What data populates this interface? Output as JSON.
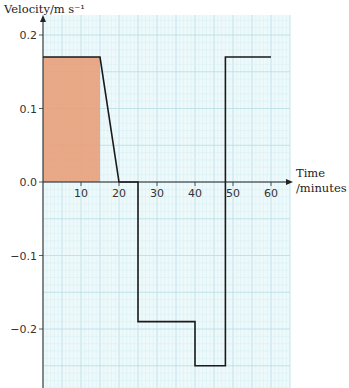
{
  "chart_data": {
    "type": "line",
    "title": "",
    "xlabel": "Time /minutes",
    "xlabel_line1": "Time",
    "xlabel_line2": "/minutes",
    "ylabel": "Velocity/m s⁻¹",
    "xlim": [
      0,
      65
    ],
    "ylim": [
      -0.27,
      0.22
    ],
    "x_ticks": [
      10,
      20,
      30,
      40,
      50,
      60
    ],
    "x_tick_labels": [
      "10",
      "20",
      "30",
      "40",
      "50",
      "60"
    ],
    "y_ticks": [
      0.2,
      0.1,
      0.0,
      -0.1,
      -0.2
    ],
    "y_tick_labels": [
      "0.2",
      "0.1",
      "0.0",
      "−0.1",
      "−0.2"
    ],
    "grid": true,
    "series": [
      {
        "name": "velocity",
        "x": [
          0,
          15,
          20,
          25,
          25,
          40,
          40,
          48,
          48,
          60
        ],
        "y": [
          0.17,
          0.17,
          0.0,
          0.0,
          -0.19,
          -0.19,
          -0.25,
          -0.25,
          0.17,
          0.17
        ]
      }
    ],
    "shaded_region": {
      "x": [
        0,
        15
      ],
      "y": [
        0,
        0.17
      ],
      "color": "#e8a07a"
    },
    "colors": {
      "grid_minor": "#d4eef2",
      "grid_major": "#b5dde6",
      "paper": "#eef9fb",
      "line": "#1a1a1a",
      "shade": "#e8a07a"
    }
  }
}
